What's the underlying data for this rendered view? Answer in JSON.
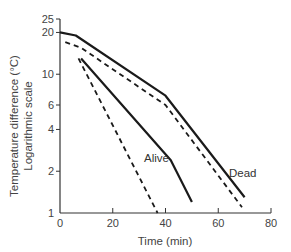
{
  "chart_data": {
    "type": "line",
    "title": "",
    "xlabel": "Time (min)",
    "ylabel": "Temperature difference (°C)",
    "ylabel_sub": "Logarithmic scale",
    "yscale": "log",
    "xlim": [
      0,
      80
    ],
    "ylim": [
      1,
      25
    ],
    "xticks": [
      0,
      20,
      40,
      60,
      80
    ],
    "yticks": [
      1,
      2,
      4,
      6,
      10,
      20,
      25
    ],
    "grid": false,
    "legend": "inline labels",
    "annotations": [
      "Alive",
      "Dead"
    ],
    "series": [
      {
        "name": "Dead (solid)",
        "style": "solid",
        "x": [
          0,
          6,
          40,
          70
        ],
        "y": [
          20,
          19,
          7.0,
          1.3
        ]
      },
      {
        "name": "Dead (dashed)",
        "style": "dashed",
        "x": [
          2,
          8,
          40,
          69
        ],
        "y": [
          17,
          15.5,
          6.0,
          1.1
        ]
      },
      {
        "name": "Alive (solid)",
        "style": "solid",
        "x": [
          8,
          42,
          50
        ],
        "y": [
          13,
          2.4,
          1.2
        ]
      },
      {
        "name": "Alive (dashed)",
        "style": "dashed",
        "x": [
          7,
          37
        ],
        "y": [
          13,
          1.0
        ]
      }
    ]
  },
  "labels": {
    "alive": "Alive",
    "dead": "Dead",
    "xlabel": "Time (min)",
    "ylabel": "Temperature difference (°C)",
    "ylabel_sub": "Logarithmic scale"
  }
}
